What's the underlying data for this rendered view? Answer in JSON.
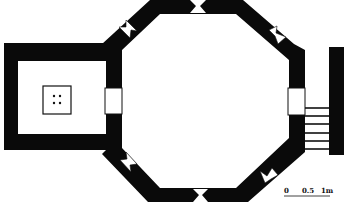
{
  "figure": {
    "type": "architectural-floor-plan",
    "colors": {
      "wall": "#0a0a0a",
      "background": "#ffffff",
      "line": "#111111"
    }
  },
  "scale_bar": {
    "labels": [
      "0",
      "0.5",
      "1m"
    ]
  },
  "elements": {
    "main_chamber": "octagon",
    "annex": "square room with central feature marked by 4 dots",
    "openings": [
      "west doorway",
      "east doorway"
    ],
    "window_slits": [
      "north",
      "north-east",
      "north-west",
      "south",
      "south-east",
      "south-west"
    ],
    "staircase_steps": 6
  }
}
